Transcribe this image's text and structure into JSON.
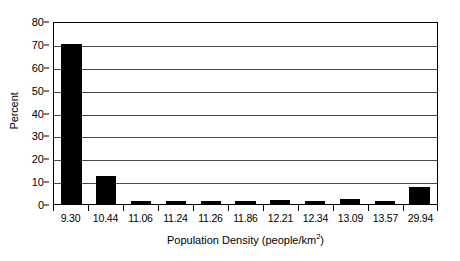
{
  "chart_data": {
    "type": "bar",
    "title": "",
    "xlabel": "Population Density (people/km²)",
    "xlabel_base": "Population Density (people/km",
    "xlabel_sup": "2",
    "xlabel_tail": ")",
    "ylabel": "Percent",
    "categories": [
      "9.30",
      "10.44",
      "11.06",
      "11.24",
      "11.26",
      "11.86",
      "12.21",
      "12.34",
      "13.09",
      "13.57",
      "29.94"
    ],
    "values": [
      70,
      12.2,
      1.3,
      1.3,
      1.4,
      1.3,
      1.9,
      1.4,
      2.1,
      1.3,
      7.6
    ],
    "ylim": [
      0,
      80
    ],
    "ytick_values": [
      0,
      10,
      20,
      30,
      40,
      50,
      60,
      70,
      80
    ],
    "ytick_labels": [
      "0",
      "10",
      "20",
      "30",
      "40",
      "50",
      "60",
      "70",
      "80"
    ],
    "grid": true,
    "grid_axis": "y",
    "legend": false,
    "legend_position": "none",
    "bar_color": "#000000",
    "background_color": "#ffffff",
    "gridline_color": "#4a4a4a",
    "axis_color": "#000000"
  }
}
